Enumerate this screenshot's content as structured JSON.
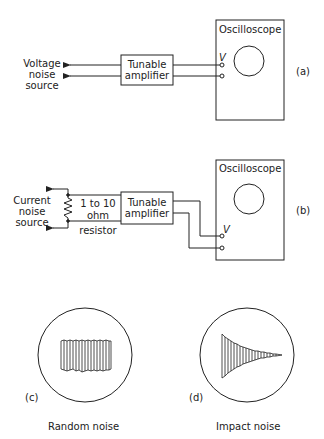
{
  "panel_a": {
    "source_label_lines": [
      "Voltage",
      "noise",
      "source"
    ],
    "amplifier_label_lines": [
      "Tunable",
      "amplifier"
    ],
    "scope_label": "Oscilloscope",
    "terminal_label": "V",
    "tag": "(a)"
  },
  "panel_b": {
    "source_label_lines": [
      "Current",
      "noise",
      "source"
    ],
    "resistor_label_lines": [
      "1 to 10",
      "ohm",
      "resistor"
    ],
    "amplifier_label_lines": [
      "Tunable",
      "amplifier"
    ],
    "scope_label": "Oscilloscope",
    "terminal_label": "V",
    "tag": "(b)"
  },
  "panel_c": {
    "tag": "(c)",
    "caption": "Random noise"
  },
  "panel_d": {
    "tag": "(d)",
    "caption": "Impact noise"
  },
  "colors": {
    "ink": "#222222",
    "background": "#ffffff"
  }
}
